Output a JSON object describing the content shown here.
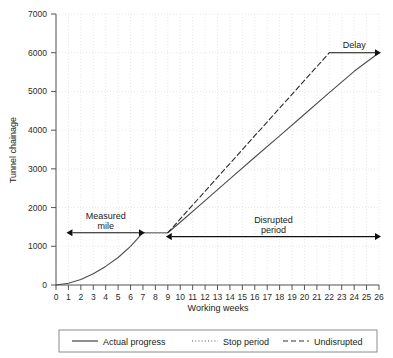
{
  "chart_data": {
    "type": "line",
    "title": "",
    "xlabel": "Working weeks",
    "ylabel": "Tunnel chainage",
    "xlim": [
      0,
      26
    ],
    "ylim": [
      0,
      7000
    ],
    "grid": true,
    "xticks": [
      "0",
      "1",
      "2",
      "3",
      "4",
      "5",
      "6",
      "7",
      "8",
      "9",
      "10",
      "11",
      "12",
      "13",
      "14",
      "15",
      "16",
      "17",
      "18",
      "19",
      "20",
      "21",
      "22",
      "23",
      "24",
      "25",
      "26"
    ],
    "yticks": [
      "0",
      "1000",
      "2000",
      "3000",
      "4000",
      "5000",
      "6000",
      "7000"
    ],
    "legend_position": "bottom",
    "series": [
      {
        "name": "Actual progress",
        "style": "solid",
        "color": "#4d4d4d",
        "points": [
          [
            0,
            0
          ],
          [
            1,
            45
          ],
          [
            2,
            140
          ],
          [
            3,
            290
          ],
          [
            4,
            480
          ],
          [
            5,
            710
          ],
          [
            6,
            1000
          ],
          [
            7,
            1350
          ],
          [
            9,
            1350
          ],
          [
            10,
            1620
          ],
          [
            12,
            2180
          ],
          [
            14,
            2740
          ],
          [
            16,
            3300
          ],
          [
            18,
            3850
          ],
          [
            20,
            4410
          ],
          [
            22,
            4970
          ],
          [
            24,
            5520
          ],
          [
            26,
            6000
          ]
        ]
      },
      {
        "name": "Stop period",
        "style": "dotted",
        "color": "#8c8c8c",
        "points": [
          [
            7,
            1350
          ],
          [
            9,
            1350
          ]
        ]
      },
      {
        "name": "Undisrupted",
        "style": "dashed",
        "color": "#2b2b2b",
        "points": [
          [
            9,
            1350
          ],
          [
            22,
            6000
          ]
        ]
      }
    ],
    "annotations": [
      {
        "id": "measured-mile",
        "label_line1": "Measured",
        "label_line2": "mile",
        "type": "double-arrow",
        "x_start": 1,
        "x_end": 7,
        "y": 1350
      },
      {
        "id": "disrupted-period",
        "label_line1": "Disrupted",
        "label_line2": "period",
        "type": "double-arrow",
        "x_start": 9,
        "x_end": 26,
        "y": 1250
      },
      {
        "id": "delay",
        "label_line1": "Delay",
        "label_line2": "",
        "type": "single-arrow",
        "x_start": 22,
        "x_end": 26,
        "y": 6000
      }
    ]
  },
  "legend": {
    "items": [
      {
        "label": "Actual progress",
        "style": "solid"
      },
      {
        "label": "Stop period",
        "style": "dotted"
      },
      {
        "label": "Undisrupted",
        "style": "dashed"
      }
    ]
  }
}
